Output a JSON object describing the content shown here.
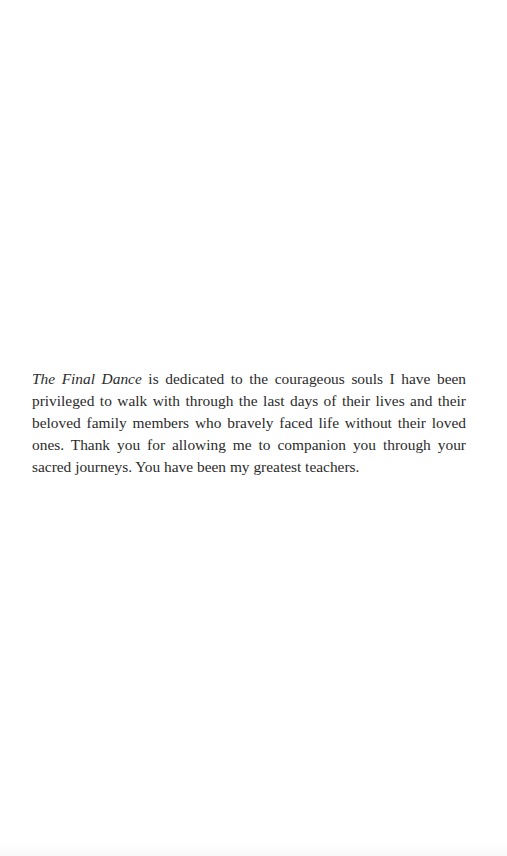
{
  "page": {
    "type": "dedication",
    "background": "#ffffff",
    "text_color": "#2b2b2b"
  },
  "dedication": {
    "book_title": "The Final Dance",
    "body": " is dedicated to the courageous souls I have been privileged to walk with through the last days of their lives and their beloved family members who bravely faced life without their loved ones. Thank you for allowing me to companion you through your sacred journeys. You have been my greatest teachers."
  }
}
